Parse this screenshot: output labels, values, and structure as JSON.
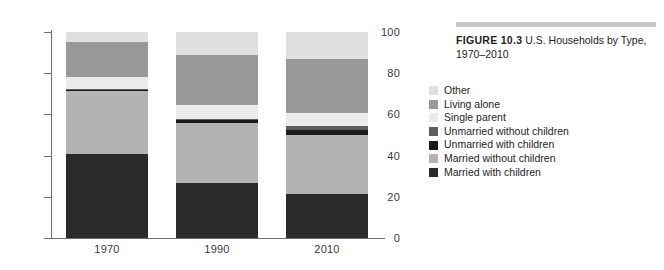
{
  "caption": {
    "label": "FIGURE 10.3",
    "text": "U.S. Households by Type, 1970–2010"
  },
  "chart_data": {
    "type": "bar",
    "subtype": "stacked-percentage",
    "title": "U.S. Households by Type, 1970–2010",
    "xlabel": "",
    "ylabel": "",
    "ylim": [
      0,
      100
    ],
    "yticks": [
      0,
      20,
      40,
      60,
      80,
      100
    ],
    "grid": false,
    "legend_position": "right",
    "categories": [
      "1970",
      "1990",
      "2010"
    ],
    "series": [
      {
        "name": "Married with children",
        "color": "#2b2b2b",
        "values": [
          41,
          26.5,
          21.5
        ]
      },
      {
        "name": "Married without children",
        "color": "#b3b3b3",
        "values": [
          30.5,
          29.5,
          28.5
        ]
      },
      {
        "name": "Unmarried with children",
        "color": "#1a1a1a",
        "values": [
          0.5,
          1.5,
          2.5
        ]
      },
      {
        "name": "Unmarried without children",
        "color": "#5e5e5e",
        "values": [
          0.5,
          0.5,
          2.0
        ]
      },
      {
        "name": "Single parent",
        "color": "#ebebeb",
        "values": [
          5.5,
          6.5,
          6.0
        ]
      },
      {
        "name": "Living alone",
        "color": "#999999",
        "values": [
          17.0,
          24.5,
          26.5
        ]
      },
      {
        "name": "Other",
        "color": "#e0e0e0",
        "values": [
          5.0,
          11.0,
          13.0
        ]
      }
    ],
    "legend_entries": [
      {
        "label": "Other",
        "color": "#e0e0e0"
      },
      {
        "label": "Living alone",
        "color": "#999999"
      },
      {
        "label": "Single parent",
        "color": "#ebebeb"
      },
      {
        "label": "Unmarried without children",
        "color": "#5e5e5e"
      },
      {
        "label": "Unmarried with children",
        "color": "#1a1a1a"
      },
      {
        "label": "Married without children",
        "color": "#b3b3b3"
      },
      {
        "label": "Married with children",
        "color": "#2b2b2b"
      }
    ]
  }
}
